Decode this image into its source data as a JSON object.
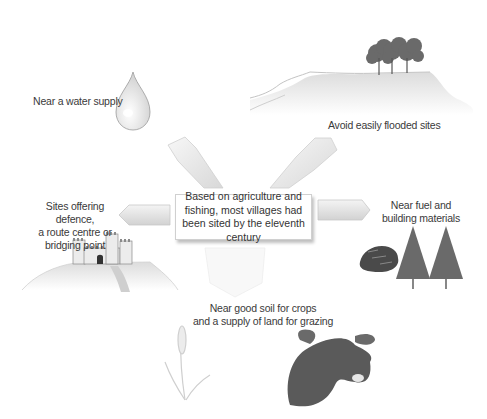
{
  "diagram": {
    "center": {
      "text": "Based on agriculture and fishing, most villages had been sited by the eleventh century"
    },
    "factors": [
      {
        "id": "water",
        "label": "Near a water supply",
        "icon": "water-drop-icon"
      },
      {
        "id": "flood",
        "label": "Avoid easily flooded sites",
        "icon": "hill-with-trees-icon"
      },
      {
        "id": "defence",
        "label": "Sites offering defence, a route centre or bridging point",
        "icon": "castle-on-hill-icon"
      },
      {
        "id": "fuel",
        "label": "Near fuel and building materials",
        "icon": "coal-and-pine-trees-icon"
      },
      {
        "id": "soil",
        "label": "Near good soil for crops and a supply of land for grazing",
        "icon": "wheat-and-cow-icon"
      }
    ],
    "labels_split": {
      "defence": [
        "Sites offering defence,",
        "a route centre or",
        "bridging point"
      ],
      "fuel": [
        "Near fuel and",
        "building materials"
      ],
      "soil": [
        "Near good soil for crops",
        "and a supply of land for grazing"
      ]
    },
    "colors": {
      "arrow_fill": "#e8e8e8",
      "arrow_stroke": "#c8c8c8",
      "hill": "#e6e6e6",
      "tree_dark": "#555555",
      "cow": "#555555",
      "coal": "#444444"
    }
  }
}
